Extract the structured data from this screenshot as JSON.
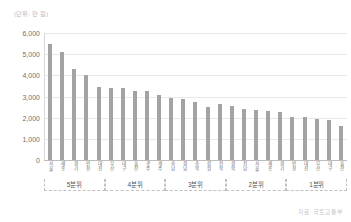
{
  "unit_caption": "(단위: 만 원)",
  "source_note": "자료: 국토교통부",
  "chart_data": {
    "type": "bar",
    "title": "",
    "subtitle": "",
    "xlabel": "",
    "ylabel": "",
    "unit": "만 원",
    "ylim": [
      0,
      6000
    ],
    "yticks": [
      0,
      1000,
      2000,
      3000,
      4000,
      5000,
      6000
    ],
    "ytick_labels": [
      "0",
      "1,000",
      "2,000",
      "3,000",
      "4,000",
      "5,000",
      "6,000"
    ],
    "grid": true,
    "legend": "none",
    "bar_color": "#a3a3a3",
    "categories": [
      "서울",
      "세종",
      "경기",
      "인천",
      "대전",
      "부산",
      "대구",
      "울산",
      "광주",
      "제주",
      "충남",
      "경남",
      "충북",
      "강원",
      "전북",
      "경북",
      "전남",
      "서울",
      "세종",
      "경기",
      "인천",
      "대전",
      "부산",
      "대구",
      "울산"
    ],
    "values": [
      5500,
      5080,
      4300,
      4000,
      3450,
      3400,
      3400,
      3250,
      3250,
      3050,
      2950,
      2900,
      2750,
      2500,
      2650,
      2550,
      2400,
      2350,
      2300,
      2250,
      2050,
      2050,
      1950,
      1900,
      1600
    ],
    "groups": [
      {
        "label": "5분위",
        "start": 0,
        "count": 5
      },
      {
        "label": "4분위",
        "start": 5,
        "count": 5
      },
      {
        "label": "3분위",
        "start": 10,
        "count": 5
      },
      {
        "label": "2분위",
        "start": 15,
        "count": 5
      },
      {
        "label": "1분위",
        "start": 20,
        "count": 5
      }
    ]
  }
}
